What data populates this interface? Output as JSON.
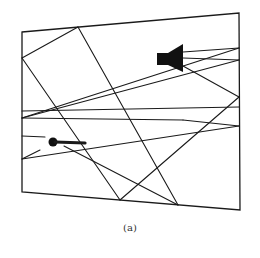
{
  "figure": {
    "caption": "(a)",
    "colors": {
      "ink": "#1a1a1a",
      "background": "#ffffff"
    },
    "room_frame": [
      [
        22,
        32
      ],
      [
        239,
        13
      ],
      [
        240,
        210
      ],
      [
        22,
        192
      ]
    ],
    "speaker": {
      "icon": "loudspeaker-icon",
      "body": [
        [
          157,
          53
        ],
        [
          170,
          53
        ],
        [
          170,
          65
        ],
        [
          157,
          65
        ]
      ],
      "cone": [
        [
          168,
          53
        ],
        [
          183,
          44
        ],
        [
          183,
          72
        ],
        [
          168,
          65
        ]
      ]
    },
    "microphone": {
      "icon": "microphone-icon",
      "head": {
        "cx": 53,
        "cy": 142,
        "r": 4.5
      },
      "handle": [
        [
          55,
          142
        ],
        [
          85,
          143
        ]
      ]
    },
    "rays": [
      [
        [
          22,
          58
        ],
        [
          78,
          27
        ]
      ],
      [
        [
          78,
          27
        ],
        [
          178,
          205
        ]
      ],
      [
        [
          22,
          58
        ],
        [
          120,
          200
        ]
      ],
      [
        [
          120,
          200
        ],
        [
          239,
          97
        ]
      ],
      [
        [
          239,
          97
        ],
        [
          183,
          66
        ]
      ],
      [
        [
          178,
          205
        ],
        [
          64,
          146
        ]
      ],
      [
        [
          22,
          111
        ],
        [
          239,
          107
        ]
      ],
      [
        [
          22,
          118
        ],
        [
          239,
          48
        ]
      ],
      [
        [
          22,
          118
        ],
        [
          183,
          120
        ]
      ],
      [
        [
          183,
          120
        ],
        [
          239,
          126
        ]
      ],
      [
        [
          22,
          118
        ],
        [
          239,
          60
        ]
      ],
      [
        [
          22,
          136
        ],
        [
          45,
          137
        ]
      ],
      [
        [
          22,
          159
        ],
        [
          239,
          126
        ]
      ],
      [
        [
          22,
          159
        ],
        [
          40,
          150
        ]
      ],
      [
        [
          183,
          52
        ],
        [
          239,
          48
        ]
      ],
      [
        [
          183,
          58
        ],
        [
          239,
          60
        ]
      ]
    ]
  }
}
